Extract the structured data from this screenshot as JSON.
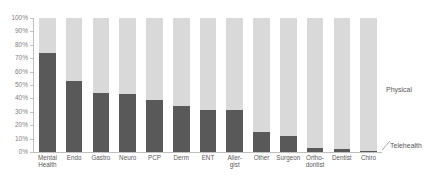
{
  "chart_data": {
    "type": "bar",
    "subtype": "100% stacked bar",
    "title": "",
    "xlabel": "",
    "ylabel": "",
    "ylim": [
      0,
      100
    ],
    "yunit": "%",
    "grid": false,
    "legend_position": "right",
    "categories": [
      "Mental Health",
      "Endo",
      "Gastro",
      "Neuro",
      "PCP",
      "Derm",
      "ENT",
      "Aller-gist",
      "Other",
      "Surgeon",
      "Ortho-dontist",
      "Dentist",
      "Chiro"
    ],
    "ytick_labels": [
      "0%",
      "10%",
      "20%",
      "30%",
      "40%",
      "50%",
      "60%",
      "70%",
      "80%",
      "90%",
      "100%"
    ],
    "ytick_values": [
      0,
      10,
      20,
      30,
      40,
      50,
      60,
      70,
      80,
      90,
      100
    ],
    "series": [
      {
        "name": "Telehealth",
        "color": "#595959",
        "values": [
          74,
          53,
          44,
          43,
          39,
          34,
          31,
          31,
          15,
          12,
          3,
          2,
          1
        ]
      },
      {
        "name": "Physical",
        "color": "#d9d9d9",
        "values": [
          26,
          47,
          56,
          57,
          61,
          66,
          69,
          69,
          85,
          88,
          97,
          98,
          99
        ]
      }
    ],
    "annotations": [
      {
        "text": "Physical",
        "series": "Physical"
      },
      {
        "text": "Telehealth",
        "series": "Telehealth"
      }
    ]
  },
  "axis": {
    "line_color": "#bfbfbf",
    "tick_color": "#808080"
  }
}
